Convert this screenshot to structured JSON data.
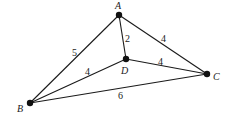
{
  "diagram": {
    "type": "weighted-graph",
    "nodes": [
      {
        "id": "A",
        "label": "A",
        "x": 119,
        "y": 15
      },
      {
        "id": "B",
        "label": "B",
        "x": 30,
        "y": 103
      },
      {
        "id": "C",
        "label": "C",
        "x": 207,
        "y": 74
      },
      {
        "id": "D",
        "label": "D",
        "x": 126,
        "y": 59
      }
    ],
    "edges": [
      {
        "from": "A",
        "to": "B",
        "weight": "5"
      },
      {
        "from": "A",
        "to": "D",
        "weight": "2"
      },
      {
        "from": "A",
        "to": "C",
        "weight": "4"
      },
      {
        "from": "B",
        "to": "D",
        "weight": "4"
      },
      {
        "from": "D",
        "to": "C",
        "weight": "4"
      },
      {
        "from": "B",
        "to": "C",
        "weight": "6"
      }
    ]
  }
}
